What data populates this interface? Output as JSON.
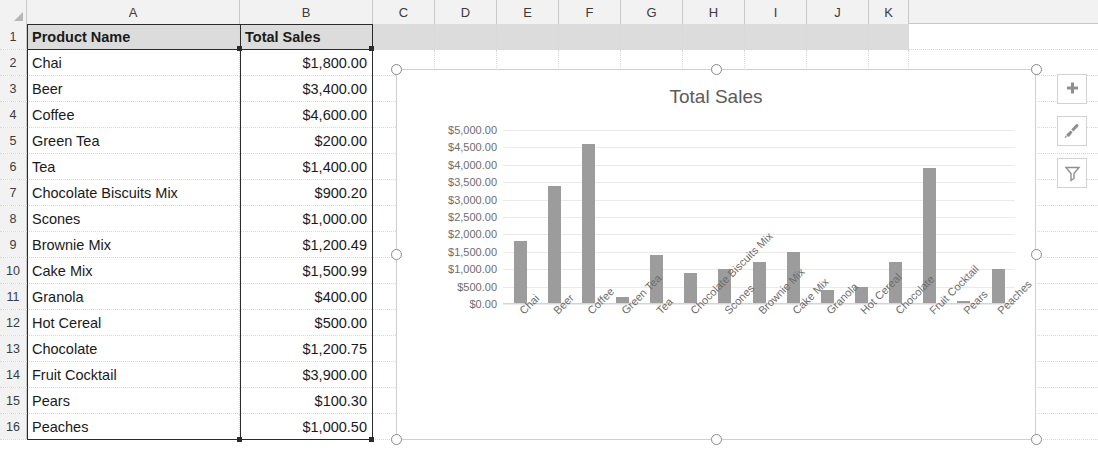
{
  "spreadsheet": {
    "column_headers": [
      "A",
      "B",
      "C",
      "D",
      "E",
      "F",
      "G",
      "H",
      "I",
      "J",
      "K"
    ],
    "row_numbers": [
      "1",
      "2",
      "3",
      "4",
      "5",
      "6",
      "7",
      "8",
      "9",
      "10",
      "11",
      "12",
      "13",
      "14",
      "15",
      "16"
    ],
    "header_row": {
      "product_name": "Product Name",
      "total_sales": "Total Sales"
    },
    "rows": [
      {
        "product": "Chai",
        "sales": "$1,800.00"
      },
      {
        "product": "Beer",
        "sales": "$3,400.00"
      },
      {
        "product": "Coffee",
        "sales": "$4,600.00"
      },
      {
        "product": "Green Tea",
        "sales": "$200.00"
      },
      {
        "product": "Tea",
        "sales": "$1,400.00"
      },
      {
        "product": "Chocolate Biscuits Mix",
        "sales": "$900.20"
      },
      {
        "product": "Scones",
        "sales": "$1,000.00"
      },
      {
        "product": "Brownie Mix",
        "sales": "$1,200.49"
      },
      {
        "product": "Cake Mix",
        "sales": "$1,500.99"
      },
      {
        "product": "Granola",
        "sales": "$400.00"
      },
      {
        "product": "Hot Cereal",
        "sales": "$500.00"
      },
      {
        "product": "Chocolate",
        "sales": "$1,200.75"
      },
      {
        "product": "Fruit Cocktail",
        "sales": "$3,900.00"
      },
      {
        "product": "Pears",
        "sales": "$100.30"
      },
      {
        "product": "Peaches",
        "sales": "$1,000.50"
      }
    ]
  },
  "chart_buttons": [
    {
      "name": "chart-elements-button",
      "icon": "plus-icon",
      "label": "Chart Elements"
    },
    {
      "name": "chart-styles-button",
      "icon": "paintbrush-icon",
      "label": "Chart Styles"
    },
    {
      "name": "chart-filters-button",
      "icon": "funnel-icon",
      "label": "Chart Filters"
    }
  ],
  "chart_data": {
    "type": "bar",
    "title": "Total Sales",
    "xlabel": "",
    "ylabel": "",
    "grid": true,
    "legend": false,
    "ylim": [
      0,
      5000
    ],
    "ytick_labels": [
      "$5,000.00",
      "$4,500.00",
      "$4,000.00",
      "$3,500.00",
      "$3,000.00",
      "$2,500.00",
      "$2,000.00",
      "$1,500.00",
      "$1,000.00",
      "$500.00",
      "$0.00"
    ],
    "ytick_values": [
      5000,
      4500,
      4000,
      3500,
      3000,
      2500,
      2000,
      1500,
      1000,
      500,
      0
    ],
    "bar_color": "#9c9c9c",
    "categories": [
      "Chai",
      "Beer",
      "Coffee",
      "Green Tea",
      "Tea",
      "Chocolate Biscuits Mix",
      "Scones",
      "Brownie Mix",
      "Cake Mix",
      "Granola",
      "Hot Cereal",
      "Chocolate",
      "Fruit Cocktail",
      "Pears",
      "Peaches"
    ],
    "values": [
      1800,
      3400,
      4600,
      200,
      1400,
      900.2,
      1000,
      1200.49,
      1500.99,
      400,
      500,
      1200.75,
      3900,
      100.3,
      1000.5
    ]
  }
}
